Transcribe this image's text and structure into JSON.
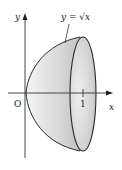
{
  "figure": {
    "curve_label": "y = √x",
    "axis_x_label": "x",
    "axis_y_label": "y",
    "origin_label": "O",
    "tick_label": "1",
    "colors": {
      "stroke": "#2a2a2a",
      "fill_light": "#f2f2f2",
      "fill_dark": "#a8a8a8"
    }
  }
}
